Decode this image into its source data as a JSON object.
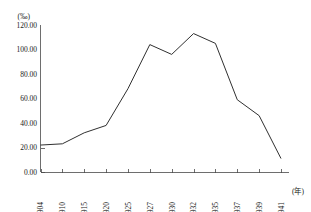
{
  "chart_data": {
    "type": "line",
    "title": "",
    "subtitle": "",
    "xlabel": "(年)",
    "ylabel": "(‰)",
    "ylim": [
      0,
      120
    ],
    "yticks": [
      0,
      20,
      40,
      60,
      80,
      100,
      120
    ],
    "ytick_labels": [
      "0.00",
      "20.00",
      "40.00",
      "60.00",
      "80.00",
      "100.00",
      "120.00"
    ],
    "categories": [
      "1904",
      "1910",
      "1915",
      "1920",
      "1925",
      "1927",
      "1930",
      "1932",
      "1935",
      "1937",
      "1939",
      "1941"
    ],
    "values": [
      22.0,
      23.0,
      32.0,
      38.0,
      68.0,
      104.0,
      96.0,
      113.0,
      105.0,
      59.0,
      46.0,
      11.0
    ],
    "series": [
      {
        "name": "",
        "values": [
          22.0,
          23.0,
          32.0,
          38.0,
          68.0,
          104.0,
          96.0,
          113.0,
          105.0,
          59.0,
          46.0,
          11.0
        ]
      }
    ],
    "grid": false,
    "legend": "none",
    "line_color": "#303030",
    "axis_color": "#4a4a4a"
  },
  "axes": {
    "y_unit": "(‰)",
    "x_unit": "(年)"
  }
}
